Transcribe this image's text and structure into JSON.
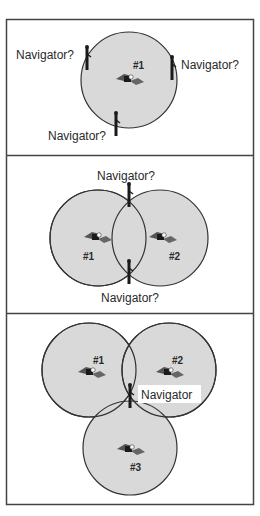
{
  "colors": {
    "frame": "#444444",
    "circle_fill": "#d9d9d9",
    "circle_stroke": "#333333",
    "text": "#2a2a2a",
    "satellite_panel": "#555555",
    "satellite_body": "#1a1a1a"
  },
  "panels": [
    {
      "id": "one-satellite",
      "satellites": [
        {
          "label": "#1"
        }
      ],
      "navigator_labels": [
        "Navigator?",
        "Navigator?",
        "Navigator?"
      ]
    },
    {
      "id": "two-satellites",
      "satellites": [
        {
          "label": "#1"
        },
        {
          "label": "#2"
        }
      ],
      "navigator_labels": [
        "Navigator?",
        "Navigator?"
      ]
    },
    {
      "id": "three-satellites",
      "satellites": [
        {
          "label": "#1"
        },
        {
          "label": "#2"
        },
        {
          "label": "#3"
        }
      ],
      "navigator_labels": [
        "Navigator"
      ]
    }
  ]
}
